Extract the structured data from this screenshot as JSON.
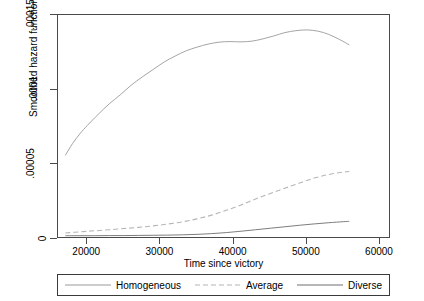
{
  "chart_data": {
    "type": "line",
    "title": "",
    "xlabel": "Time since victory",
    "ylabel": "Smoothed hazard function",
    "xlim": [
      16000,
      61500
    ],
    "ylim": [
      0,
      0.00015
    ],
    "grid": false,
    "legend_position": "bottom",
    "xticks": [
      20000,
      30000,
      40000,
      50000,
      60000
    ],
    "xticklabels": [
      "20000",
      "30000",
      "40000",
      "50000",
      "60000"
    ],
    "yticks": [
      0,
      5e-05,
      0.0001,
      0.00015
    ],
    "yticklabels": [
      "0",
      ".00005",
      ".0001",
      ".00015"
    ],
    "series": [
      {
        "name": "Homogeneous",
        "style": "solid",
        "color": "#9a9a9a",
        "x": [
          17000,
          18000,
          19000,
          20000,
          21500,
          23000,
          24500,
          26000,
          27500,
          29000,
          30500,
          32000,
          33500,
          35000,
          36500,
          38000,
          39500,
          41000,
          42500,
          44000,
          45500,
          47000,
          48500,
          50000,
          51500,
          53000,
          54500,
          55800
        ],
        "y": [
          5.6e-05,
          6.4e-05,
          7.05e-05,
          7.6e-05,
          8.35e-05,
          9.05e-05,
          9.65e-05,
          0.000103,
          0.0001085,
          0.0001135,
          0.0001185,
          0.0001225,
          0.000126,
          0.0001285,
          0.0001305,
          0.0001318,
          0.0001322,
          0.000132,
          0.0001325,
          0.000134,
          0.000136,
          0.0001382,
          0.0001395,
          0.00014,
          0.0001392,
          0.000137,
          0.0001335,
          0.00013
        ]
      },
      {
        "name": "Average",
        "style": "dashed",
        "color": "#b5b5b5",
        "x": [
          17000,
          19000,
          21000,
          23000,
          25000,
          27000,
          29000,
          31000,
          33000,
          35000,
          37000,
          39000,
          41000,
          43000,
          45000,
          47000,
          49000,
          51000,
          53000,
          55000,
          55800
        ],
        "y": [
          4e-06,
          4.8e-06,
          5.5e-06,
          6.2e-06,
          7e-06,
          7.8e-06,
          8.8e-06,
          1e-05,
          1.15e-05,
          1.35e-05,
          1.6e-05,
          1.92e-05,
          2.28e-05,
          2.68e-05,
          3.05e-05,
          3.4e-05,
          3.75e-05,
          4.08e-05,
          4.32e-05,
          4.48e-05,
          4.52e-05
        ]
      },
      {
        "name": "Diverse",
        "style": "solid",
        "color": "#6e6e6e",
        "x": [
          17000,
          19000,
          21000,
          23000,
          25000,
          27000,
          29000,
          31000,
          33000,
          35000,
          37000,
          39000,
          41000,
          43000,
          45000,
          47000,
          49000,
          51000,
          53000,
          55000,
          55800
        ],
        "y": [
          2.2e-06,
          2.2e-06,
          2.2e-06,
          2.3e-06,
          2.3e-06,
          2.4e-06,
          2.5e-06,
          2.6e-06,
          2.8e-06,
          3.1e-06,
          3.6e-06,
          4.3e-06,
          5.2e-06,
          6.2e-06,
          7.2e-06,
          8.2e-06,
          9.2e-06,
          1.01e-05,
          1.09e-05,
          1.16e-05,
          1.18e-05
        ]
      }
    ]
  },
  "legend": {
    "items": [
      {
        "label": "Homogeneous"
      },
      {
        "label": "Average"
      },
      {
        "label": "Diverse"
      }
    ]
  }
}
